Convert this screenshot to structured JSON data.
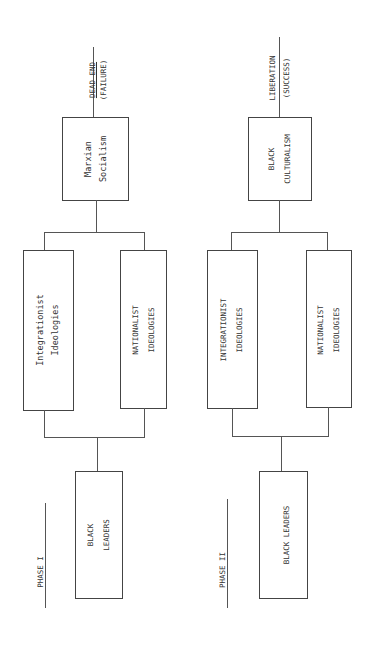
{
  "diagram": {
    "orientation": "rotated 90deg counter-clockwise (reads bottom to top)",
    "phases": [
      {
        "label": "PHASE I",
        "origin": {
          "line1": "BLACK",
          "line2": "LEADERS"
        },
        "ideologies": [
          {
            "line1": "Integrationist",
            "line2": "Ideologies"
          },
          {
            "line1": "NATIONALIST",
            "line2": "IDEOLOGIES"
          }
        ],
        "synthesis": {
          "line1": "Marxian",
          "line2": "Socialism"
        },
        "outcome": {
          "line1": "DEAD END",
          "line2": "(FAILURE)"
        }
      },
      {
        "label": "PHASE II",
        "origin": {
          "line1": "BLACK LEADERS"
        },
        "ideologies": [
          {
            "line1": "INTEGRATIONIST",
            "line2": "IDEOLOGIES"
          },
          {
            "line1": "NATIONALIST",
            "line2": "IDEOLOGIES"
          }
        ],
        "synthesis": {
          "line1": "BLACK",
          "line2": "CULTURALISM"
        },
        "outcome": {
          "line1": "LIBERATION",
          "line2": "(SUCCESS)"
        }
      }
    ],
    "colors": {
      "line": "#444444",
      "text": "#333333",
      "background": "#ffffff"
    }
  }
}
